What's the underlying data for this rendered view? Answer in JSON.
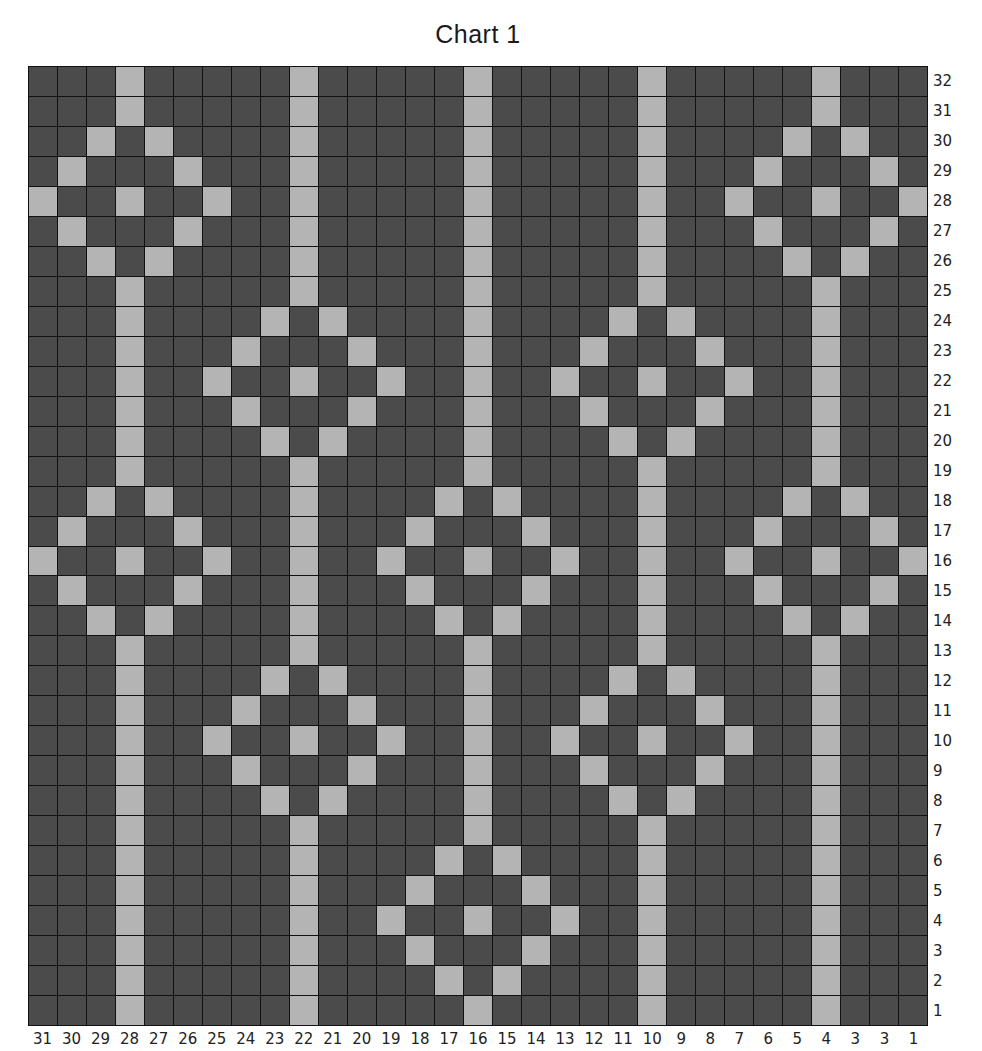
{
  "title": "Chart 1",
  "colors": {
    "stitch_dark": "#4b4b4b",
    "stitch_light": "#b4b4b4",
    "gridline": "#111111"
  },
  "column_labels": [
    "31",
    "30",
    "29",
    "28",
    "27",
    "26",
    "25",
    "24",
    "23",
    "22",
    "21",
    "20",
    "19",
    "18",
    "17",
    "16",
    "15",
    "14",
    "13",
    "12",
    "11",
    "10",
    "9",
    "8",
    "7",
    "6",
    "5",
    "4",
    "3",
    "3",
    "1"
  ],
  "row_labels": [
    "32",
    "31",
    "30",
    "29",
    "28",
    "27",
    "26",
    "25",
    "24",
    "23",
    "22",
    "21",
    "20",
    "19",
    "18",
    "17",
    "16",
    "15",
    "14",
    "13",
    "12",
    "11",
    "10",
    "9",
    "8",
    "7",
    "6",
    "5",
    "4",
    "3",
    "2",
    "1"
  ],
  "chart_data": {
    "type": "heatmap",
    "title": "Chart 1",
    "columns": 31,
    "rows": 32,
    "xlabels": [
      "31",
      "30",
      "29",
      "28",
      "27",
      "26",
      "25",
      "24",
      "23",
      "22",
      "21",
      "20",
      "19",
      "18",
      "17",
      "16",
      "15",
      "14",
      "13",
      "12",
      "11",
      "10",
      "9",
      "8",
      "7",
      "6",
      "5",
      "4",
      "3",
      "3",
      "1"
    ],
    "ylabels_top_to_bottom": [
      "32",
      "31",
      "30",
      "29",
      "28",
      "27",
      "26",
      "25",
      "24",
      "23",
      "22",
      "21",
      "20",
      "19",
      "18",
      "17",
      "16",
      "15",
      "14",
      "13",
      "12",
      "11",
      "10",
      "9",
      "8",
      "7",
      "6",
      "5",
      "4",
      "3",
      "2",
      "1"
    ],
    "light_cells_by_row": {
      "32": [
        3,
        9,
        15,
        21,
        27
      ],
      "31": [
        3,
        9,
        15,
        21,
        27
      ],
      "30": [
        2,
        4,
        9,
        15,
        21,
        26,
        28
      ],
      "29": [
        1,
        5,
        9,
        15,
        21,
        25,
        29
      ],
      "28": [
        0,
        3,
        6,
        9,
        15,
        21,
        24,
        27,
        30
      ],
      "27": [
        1,
        5,
        9,
        15,
        21,
        25,
        29
      ],
      "26": [
        2,
        4,
        9,
        15,
        21,
        26,
        28
      ],
      "25": [
        3,
        9,
        15,
        21,
        27
      ],
      "24": [
        3,
        8,
        10,
        15,
        20,
        22,
        27
      ],
      "23": [
        3,
        7,
        11,
        15,
        19,
        23,
        27
      ],
      "22": [
        3,
        6,
        9,
        12,
        15,
        18,
        21,
        24,
        27
      ],
      "21": [
        3,
        7,
        11,
        15,
        19,
        23,
        27
      ],
      "20": [
        3,
        8,
        10,
        15,
        20,
        22,
        27
      ],
      "19": [
        3,
        9,
        15,
        21,
        27
      ],
      "18": [
        2,
        4,
        9,
        14,
        16,
        21,
        26,
        28
      ],
      "17": [
        1,
        5,
        9,
        13,
        17,
        21,
        25,
        29
      ],
      "16": [
        0,
        3,
        6,
        9,
        12,
        15,
        18,
        21,
        24,
        27,
        30
      ],
      "15": [
        1,
        5,
        9,
        13,
        17,
        21,
        25,
        29
      ],
      "14": [
        2,
        4,
        9,
        14,
        16,
        21,
        26,
        28
      ],
      "13": [
        3,
        9,
        15,
        21,
        27
      ],
      "12": [
        3,
        8,
        10,
        15,
        20,
        22,
        27
      ],
      "11": [
        3,
        7,
        11,
        15,
        19,
        23,
        27
      ],
      "10": [
        3,
        6,
        9,
        12,
        15,
        18,
        21,
        24,
        27
      ],
      "9": [
        3,
        7,
        11,
        15,
        19,
        23,
        27
      ],
      "8": [
        3,
        8,
        10,
        15,
        20,
        22,
        27
      ],
      "7": [
        3,
        9,
        15,
        21,
        27
      ],
      "6": [
        3,
        9,
        14,
        16,
        21,
        27
      ],
      "5": [
        3,
        9,
        13,
        17,
        21,
        27
      ],
      "4": [
        3,
        9,
        12,
        15,
        18,
        21,
        27
      ],
      "3": [
        3,
        9,
        13,
        17,
        21,
        27
      ],
      "2": [
        3,
        9,
        14,
        16,
        21,
        27
      ],
      "1": [
        3,
        9,
        15,
        21,
        27
      ]
    },
    "legend": [],
    "grid": true
  }
}
